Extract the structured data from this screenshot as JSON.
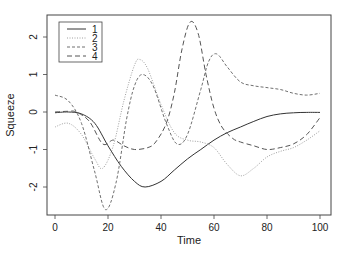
{
  "chart_data": {
    "type": "line",
    "title": "",
    "xlabel": "Time",
    "ylabel": "Squeeze",
    "xlim": [
      -3,
      103
    ],
    "ylim": [
      -2.75,
      2.6
    ],
    "xticks": [
      0,
      20,
      40,
      60,
      80,
      100
    ],
    "yticks": [
      -2,
      -1,
      0,
      1,
      2
    ],
    "grid": false,
    "legend_position": "top-left",
    "series": [
      {
        "name": "1",
        "style": "solid",
        "color": "#333333",
        "x": [
          0,
          5,
          10,
          15,
          20,
          25,
          30,
          34,
          40,
          45,
          50,
          55,
          60,
          65,
          70,
          75,
          80,
          85,
          90,
          95,
          100
        ],
        "values": [
          -0.02,
          0.0,
          -0.05,
          -0.3,
          -0.9,
          -1.45,
          -1.85,
          -2.0,
          -1.85,
          -1.55,
          -1.25,
          -1.0,
          -0.75,
          -0.55,
          -0.4,
          -0.25,
          -0.12,
          -0.05,
          -0.02,
          -0.01,
          -0.01
        ]
      },
      {
        "name": "2",
        "style": "dotted",
        "color": "#a0a0a0",
        "x": [
          0,
          5,
          10,
          15,
          18,
          22,
          26,
          30,
          32,
          35,
          40,
          45,
          50,
          55,
          60,
          65,
          70,
          75,
          80,
          85,
          90,
          95,
          100
        ],
        "values": [
          -0.4,
          -0.3,
          -0.6,
          -1.25,
          -1.5,
          -0.9,
          0.3,
          1.25,
          1.4,
          1.15,
          0.2,
          -0.55,
          -0.75,
          -0.8,
          -0.95,
          -1.4,
          -1.7,
          -1.5,
          -1.2,
          -1.05,
          -0.95,
          -0.75,
          -0.5
        ]
      },
      {
        "name": "3",
        "style": "short-dash",
        "color": "#707070",
        "x": [
          0,
          5,
          10,
          15,
          19,
          23,
          27,
          30,
          33,
          37,
          42,
          46,
          50,
          55,
          58,
          61,
          65,
          70,
          75,
          80,
          85,
          90,
          95,
          100
        ],
        "values": [
          0.45,
          0.3,
          -0.3,
          -1.6,
          -2.6,
          -1.9,
          -0.2,
          0.7,
          1.0,
          0.7,
          -0.3,
          -0.85,
          -0.6,
          0.6,
          1.35,
          1.55,
          1.2,
          0.8,
          0.7,
          0.65,
          0.6,
          0.5,
          0.45,
          0.5
        ]
      },
      {
        "name": "4",
        "style": "long-dash",
        "color": "#555555",
        "x": [
          0,
          5,
          8,
          13,
          18,
          22,
          26,
          30,
          35,
          38,
          42,
          45,
          48,
          51,
          54,
          57,
          60,
          63,
          67,
          70,
          75,
          80,
          85,
          90,
          95,
          100
        ],
        "values": [
          0.0,
          0.02,
          0.0,
          -0.25,
          -0.85,
          -0.75,
          -0.9,
          -1.0,
          -0.95,
          -0.8,
          -0.3,
          0.5,
          1.7,
          2.4,
          2.1,
          1.0,
          0.1,
          -0.4,
          -0.7,
          -0.8,
          -0.9,
          -1.0,
          -0.95,
          -0.85,
          -0.6,
          -0.15
        ]
      }
    ]
  },
  "legend": {
    "items": [
      {
        "label": "1",
        "style": "solid"
      },
      {
        "label": "2",
        "style": "dotted"
      },
      {
        "label": "3",
        "style": "short-dash"
      },
      {
        "label": "4",
        "style": "long-dash"
      }
    ]
  },
  "axes": {
    "xlabel": "Time",
    "ylabel": "Squeeze",
    "xtick_labels": [
      "0",
      "20",
      "40",
      "60",
      "80",
      "100"
    ],
    "ytick_labels": [
      "-2",
      "-1",
      "0",
      "1",
      "2"
    ]
  }
}
